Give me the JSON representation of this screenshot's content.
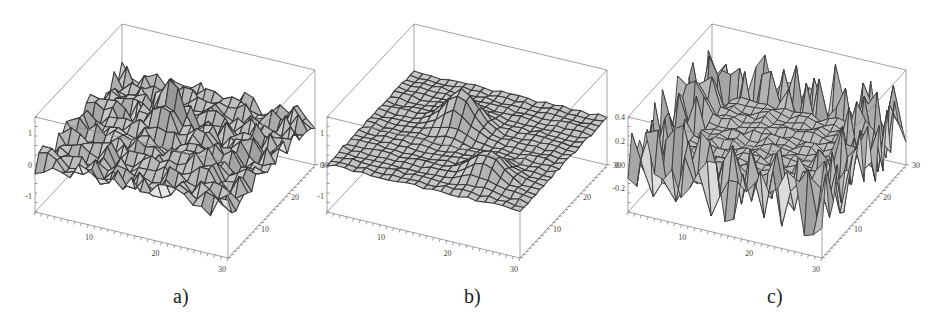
{
  "chart_data": [
    {
      "type": "surface3d",
      "panel": "a",
      "caption": "a)",
      "description": "Noisy surface with two Gaussian-like bumps on a 30x30 grid",
      "x_ticks": [
        "10",
        "20",
        "30"
      ],
      "y_ticks": [
        "10",
        "20",
        "30"
      ],
      "z_ticks": [
        "1",
        "0",
        "-1"
      ],
      "xlim": [
        1,
        30
      ],
      "ylim": [
        1,
        30
      ],
      "zlim": [
        -1.5,
        1.5
      ],
      "grid_size": 30,
      "noise": 0.35,
      "bumps": [
        {
          "x": 13,
          "y": 19,
          "amp": 1.1
        },
        {
          "x": 22,
          "y": 8,
          "amp": 0.7
        }
      ]
    },
    {
      "type": "surface3d",
      "panel": "b",
      "caption": "b)",
      "description": "Smoothed (denoised) surface with two bumps on a 30x30 grid",
      "x_ticks": [
        "10",
        "20",
        "30"
      ],
      "y_ticks": [
        "10",
        "20",
        "30"
      ],
      "z_ticks": [
        "1",
        "0",
        "-1"
      ],
      "xlim": [
        1,
        30
      ],
      "ylim": [
        1,
        30
      ],
      "zlim": [
        -1.5,
        1.5
      ],
      "grid_size": 30,
      "noise": 0.05,
      "bumps": [
        {
          "x": 13,
          "y": 19,
          "amp": 1.1
        },
        {
          "x": 22,
          "y": 8,
          "amp": 0.7
        }
      ]
    },
    {
      "type": "surface3d",
      "panel": "c",
      "caption": "c)",
      "description": "Residual / noise surface, strong oscillation near edges",
      "x_ticks": [
        "10",
        "20",
        "30"
      ],
      "y_ticks": [
        "10",
        "20",
        "30"
      ],
      "z_ticks": [
        "0.4",
        "0.2",
        "0.0",
        "-0.2"
      ],
      "xlim": [
        1,
        30
      ],
      "ylim": [
        1,
        30
      ],
      "zlim": [
        -0.4,
        0.4
      ],
      "grid_size": 30,
      "noise": 0.3,
      "bumps": []
    }
  ],
  "captions": [
    "a)",
    "b)",
    "c)"
  ],
  "colors": {
    "surface": "#c8c8c8",
    "mesh": "#3a3a3a",
    "box": "#8a8a8a"
  }
}
